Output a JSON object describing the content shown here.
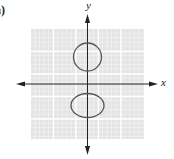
{
  "figure": {
    "part_label": "a)",
    "x_axis_label": "x",
    "y_axis_label": "y",
    "colors": {
      "grid_background": "#e6e6e6",
      "grid_minor": "#f7f7f7",
      "grid_major": "#ffffff",
      "axis": "#222222",
      "curve": "#555555"
    },
    "curves": [
      {
        "name": "upper-circle",
        "shape": "circle",
        "position": "above x-axis, centered on y-axis"
      },
      {
        "name": "lower-ellipse",
        "shape": "ellipse",
        "position": "below x-axis, centered on y-axis, horizontally elongated"
      }
    ]
  }
}
